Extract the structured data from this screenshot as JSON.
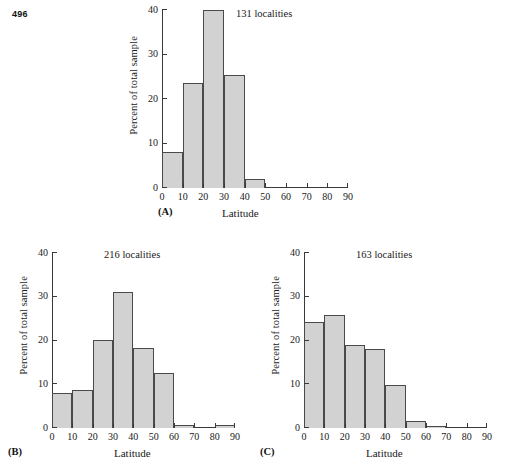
{
  "page": {
    "number": "496"
  },
  "figure": {
    "panels": [
      {
        "tag": "(A)",
        "annotation": "131 localities",
        "chart_data": {
          "type": "bar",
          "title": "131 localities",
          "xlabel": "Latitude",
          "ylabel": "Percent of total sample",
          "categories": [
            "0-10",
            "10-20",
            "20-30",
            "30-40",
            "40-50",
            "50-60",
            "60-70",
            "70-80",
            "80-90"
          ],
          "bin_edges": [
            0,
            10,
            20,
            30,
            40,
            50,
            60,
            70,
            80,
            90
          ],
          "values": [
            8.0,
            23.7,
            40.0,
            25.5,
            2.0,
            0,
            0,
            0,
            0
          ],
          "xlim": [
            0,
            90
          ],
          "ylim": [
            0,
            40
          ],
          "xticks": [
            0,
            10,
            20,
            30,
            40,
            50,
            60,
            70,
            80,
            90
          ],
          "yticks": [
            0,
            10,
            20,
            30,
            40
          ],
          "grid": false,
          "legend": "none"
        }
      },
      {
        "tag": "(B)",
        "annotation": "216 localities",
        "chart_data": {
          "type": "bar",
          "title": "216 localities",
          "xlabel": "Latitude",
          "ylabel": "Percent of total sample",
          "categories": [
            "0-10",
            "10-20",
            "20-30",
            "30-40",
            "40-50",
            "50-60",
            "60-70",
            "70-80",
            "80-90"
          ],
          "bin_edges": [
            0,
            10,
            20,
            30,
            40,
            50,
            60,
            70,
            80,
            90
          ],
          "values": [
            8.0,
            8.7,
            20.2,
            31.0,
            18.3,
            12.5,
            0.7,
            0,
            0.7
          ],
          "xlim": [
            0,
            90
          ],
          "ylim": [
            0,
            40
          ],
          "xticks": [
            0,
            10,
            20,
            30,
            40,
            50,
            60,
            70,
            80,
            90
          ],
          "yticks": [
            0,
            10,
            20,
            30,
            40
          ],
          "grid": false,
          "legend": "none"
        }
      },
      {
        "tag": "(C)",
        "annotation": "163 localities",
        "chart_data": {
          "type": "bar",
          "title": "163 localities",
          "xlabel": "Latitude",
          "ylabel": "Percent of total sample",
          "categories": [
            "0-10",
            "10-20",
            "20-30",
            "30-40",
            "40-50",
            "50-60",
            "60-70",
            "70-80",
            "80-90"
          ],
          "bin_edges": [
            0,
            10,
            20,
            30,
            40,
            50,
            60,
            70,
            80,
            90
          ],
          "values": [
            24.3,
            25.8,
            19.0,
            18.0,
            9.8,
            1.6,
            0.5,
            0,
            0
          ],
          "xlim": [
            0,
            90
          ],
          "ylim": [
            0,
            40
          ],
          "xticks": [
            0,
            10,
            20,
            30,
            40,
            50,
            60,
            70,
            80,
            90
          ],
          "yticks": [
            0,
            10,
            20,
            30,
            40
          ],
          "grid": false,
          "legend": "none"
        }
      }
    ]
  },
  "style": {
    "bar_fill": "#d2d2d2",
    "bar_stroke": "#4a4a4a",
    "axis_color": "#3a3a3a",
    "text_color": "#1a1a1a"
  }
}
